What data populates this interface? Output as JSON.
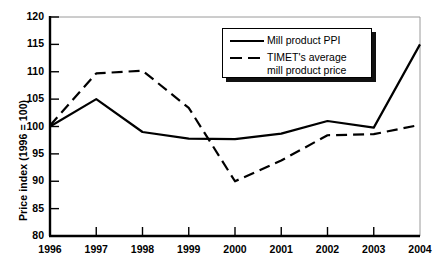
{
  "chart_data": {
    "type": "line",
    "title": "",
    "xlabel": "",
    "ylabel": "Price index (1996 = 100)",
    "categories": [
      "1996",
      "1997",
      "1998",
      "1999",
      "2000",
      "2001",
      "2002",
      "2003",
      "2004"
    ],
    "x": [
      1996,
      1997,
      1998,
      1999,
      2000,
      2001,
      2002,
      2003,
      2004
    ],
    "xlim": [
      1996,
      2004
    ],
    "ylim": [
      80,
      120
    ],
    "yticks": [
      "80",
      "85",
      "90",
      "95",
      "100",
      "105",
      "110",
      "115",
      "120"
    ],
    "ytick_values": [
      80,
      85,
      90,
      95,
      100,
      105,
      110,
      115,
      120
    ],
    "grid": false,
    "legend_position": "top-right",
    "series": [
      {
        "name": "Mill product PPI",
        "style": "solid",
        "color": "#000000",
        "values": [
          100.0,
          105.0,
          99.0,
          97.8,
          97.7,
          98.7,
          101.0,
          99.8,
          115.0
        ]
      },
      {
        "name": "TIMET's average\nmill product price",
        "style": "dashed",
        "color": "#000000",
        "values": [
          100.2,
          109.7,
          110.2,
          103.4,
          90.0,
          93.8,
          98.4,
          98.6,
          100.3
        ]
      }
    ]
  },
  "legend": {
    "entries": [
      {
        "label": "Mill product PPI",
        "style": "solid"
      },
      {
        "label": "TIMET's average\nmill product price",
        "style": "dashed"
      }
    ]
  },
  "colors": {
    "line": "#000000",
    "axis": "#000000",
    "frame": "#9a9a9a",
    "background": "#ffffff",
    "legend_shadow": "#111111"
  }
}
